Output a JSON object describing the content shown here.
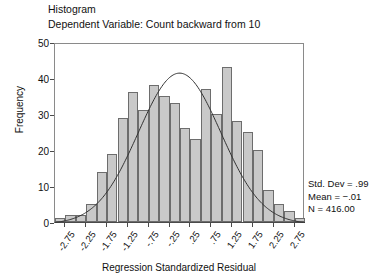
{
  "chart_data": {
    "type": "bar",
    "title": "Histogram",
    "subtitle": "Dependent Variable: Count backward from 10",
    "xlabel": "Regression Standardized Residual",
    "ylabel": "Frequency",
    "ylim": [
      0,
      50
    ],
    "ytick_values": [
      0,
      10,
      20,
      30,
      40,
      50
    ],
    "ytick_labels": [
      "0",
      "10",
      "20",
      "30",
      "40",
      "50"
    ],
    "xlim": [
      -3.0,
      3.0
    ],
    "xtick_values": [
      -2.75,
      -2.25,
      -1.75,
      -1.25,
      -0.75,
      -0.25,
      0.25,
      0.75,
      1.25,
      1.75,
      2.25,
      2.75
    ],
    "xtick_labels": [
      "-2.75",
      "-2.25",
      "-1.75",
      "-1.25",
      "-.75",
      "-.25",
      ".25",
      ".75",
      "1.25",
      "1.75",
      "2.25",
      "2.75"
    ],
    "grid": false,
    "legend": false,
    "bin_width": 0.25,
    "bin_centers": [
      -2.875,
      -2.625,
      -2.375,
      -2.125,
      -1.875,
      -1.625,
      -1.375,
      -1.125,
      -0.875,
      -0.625,
      -0.375,
      -0.125,
      0.125,
      0.375,
      0.625,
      0.875,
      1.125,
      1.375,
      1.625,
      1.875,
      2.125,
      2.375,
      2.625,
      2.875
    ],
    "categories": [
      "-2.875",
      "-2.625",
      "-2.375",
      "-2.125",
      "-1.875",
      "-1.625",
      "-1.375",
      "-1.125",
      "-0.875",
      "-0.625",
      "-0.375",
      "-0.125",
      "0.125",
      "0.375",
      "0.625",
      "0.875",
      "1.125",
      "1.375",
      "1.625",
      "1.875",
      "2.125",
      "2.375",
      "2.625",
      "2.875"
    ],
    "values": [
      1,
      2,
      2,
      5,
      14,
      19,
      29,
      36,
      31,
      38,
      35,
      33,
      26,
      23,
      37,
      30,
      43,
      28,
      25,
      20,
      9,
      5,
      3,
      1
    ],
    "overlay_curve": {
      "type": "normal",
      "mean": -0.01,
      "std_dev": 0.99,
      "n": 416,
      "peak_frequency": 41.6
    },
    "bar_fill_color": "#c9c9c9",
    "bar_edge_color": "#6d6d6d",
    "curve_color": "#333333",
    "axis_color": "#4a4a4a"
  },
  "stats": {
    "std_dev": "Std. Dev = .99",
    "mean": "Mean = −.01",
    "n": "N = 416.00"
  }
}
